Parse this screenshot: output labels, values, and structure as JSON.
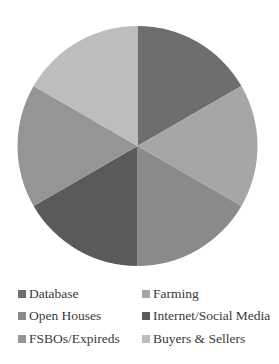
{
  "chart_data": {
    "type": "pie",
    "title": "",
    "categories": [
      "Database",
      "Farming",
      "Open Houses",
      "Internet/Social Media",
      "FSBOs/Expireds",
      "Buyers & Sellers"
    ],
    "values": [
      16.67,
      16.67,
      16.67,
      16.67,
      16.67,
      16.67
    ],
    "colors": [
      "#6e6e6e",
      "#a6a6a6",
      "#8a8a8a",
      "#5a5a5a",
      "#959595",
      "#bdbdbd"
    ],
    "start_angle_deg": 0,
    "direction": "clockwise",
    "legend_position": "bottom",
    "legend_columns": 2
  },
  "legend": {
    "items": [
      {
        "label": "Database",
        "color": "#6e6e6e"
      },
      {
        "label": "Farming",
        "color": "#a6a6a6"
      },
      {
        "label": "Open Houses",
        "color": "#8a8a8a"
      },
      {
        "label": "Internet/Social Media",
        "color": "#5a5a5a"
      },
      {
        "label": "FSBOs/Expireds",
        "color": "#959595"
      },
      {
        "label": "Buyers & Sellers",
        "color": "#bdbdbd"
      }
    ]
  }
}
